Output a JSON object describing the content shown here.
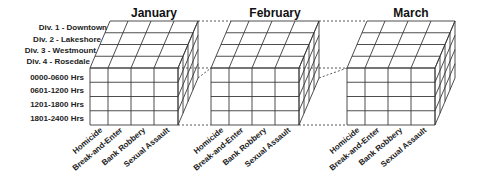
{
  "diagram": {
    "months": [
      "January",
      "February",
      "March"
    ],
    "divisions": [
      "Div. 1 - Downtown",
      "Div. 2 - Lakeshore",
      "Div. 3 - Westmount",
      "Div. 4 - Rosedale"
    ],
    "time_periods": [
      "0000-0600 Hrs",
      "0601-1200 Hrs",
      "1201-1800 Hrs",
      "1801-2400 Hrs"
    ],
    "crime_types": [
      "Homicide",
      "Break-and-Enter",
      "Bank Robbery",
      "Sexual Assault"
    ],
    "colors": {
      "lines": "#3a3a3a",
      "text": "#222222",
      "background": "#ffffff"
    }
  }
}
